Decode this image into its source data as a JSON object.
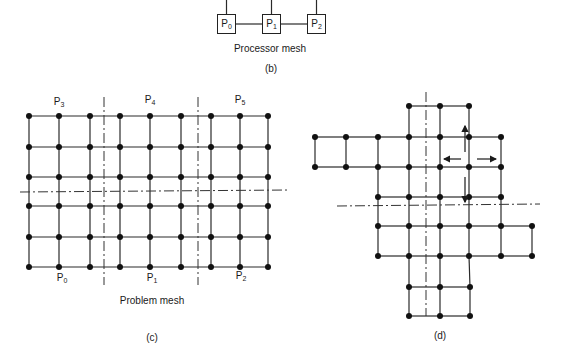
{
  "panel_b": {
    "processors": [
      {
        "name": "P",
        "sub": "0",
        "x": 217,
        "y": 14
      },
      {
        "name": "P",
        "sub": "1",
        "x": 262,
        "y": 14
      },
      {
        "name": "P",
        "sub": "2",
        "x": 307,
        "y": 14
      }
    ],
    "title": "Processor mesh",
    "label": "(b)"
  },
  "panel_c": {
    "title": "Problem mesh",
    "label": "(c)",
    "partition_labels": [
      {
        "name": "P",
        "sub": "3",
        "x": 59,
        "y": 103
      },
      {
        "name": "P",
        "sub": "4",
        "x": 150,
        "y": 101
      },
      {
        "name": "P",
        "sub": "5",
        "x": 240,
        "y": 101
      },
      {
        "name": "P",
        "sub": "0",
        "x": 62,
        "y": 279
      },
      {
        "name": "P",
        "sub": "1",
        "x": 152,
        "y": 279
      },
      {
        "name": "P",
        "sub": "2",
        "x": 241,
        "y": 277
      }
    ],
    "grid": {
      "cols_x": [
        29,
        59,
        90,
        120,
        150,
        181,
        211,
        240,
        268
      ],
      "rows_y": [
        116,
        147,
        177,
        206,
        237,
        267
      ]
    },
    "partition_lines": {
      "vertical_x": [
        104,
        198
      ],
      "horizontal_y": 192
    }
  },
  "panel_d": {
    "label": "(d)",
    "nodes_by_row": [
      {
        "y": 106,
        "xs": [
          409,
          440,
          469
        ]
      },
      {
        "y": 137,
        "xs": [
          315,
          346,
          378,
          409,
          440,
          469,
          501
        ]
      },
      {
        "y": 167,
        "xs": [
          315,
          346,
          378,
          409,
          440,
          469,
          501
        ]
      },
      {
        "y": 197,
        "xs": [
          378,
          409,
          440,
          469,
          501
        ]
      },
      {
        "y": 226,
        "xs": [
          378,
          409,
          440,
          469,
          501,
          532
        ]
      },
      {
        "y": 256,
        "xs": [
          378,
          409,
          440,
          469,
          501,
          532
        ]
      },
      {
        "y": 287,
        "xs": [
          409,
          440,
          470
        ]
      },
      {
        "y": 316,
        "xs": [
          409,
          440,
          470
        ]
      }
    ],
    "partition_lines": {
      "vertical_x": 426,
      "horizontal_y": 206
    },
    "arrows": [
      "up",
      "down",
      "left",
      "right"
    ]
  }
}
